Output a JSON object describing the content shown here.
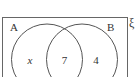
{
  "diagram": {
    "type": "venn",
    "universal_symbol": "ξ",
    "sets": [
      {
        "label": "A"
      },
      {
        "label": "B"
      }
    ],
    "regions": {
      "a_only": "x",
      "a_and_b": "7",
      "b_only": "4"
    },
    "colors": {
      "stroke": "#555555",
      "text": "#333333",
      "background": "#ffffff"
    }
  }
}
